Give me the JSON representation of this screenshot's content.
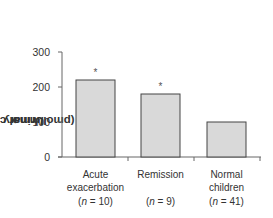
{
  "chart_data": {
    "type": "bar",
    "title": "",
    "xlabel": "",
    "ylabel": "Urinary LTE4 (pmol/mmol creatinine)",
    "ylabel_parts": {
      "prefix": "Urinary LTE",
      "sub": "4",
      "suffix": " (pmol/mmol creatinine)"
    },
    "ylim": [
      0,
      300
    ],
    "yticks": [
      0,
      100,
      200,
      300
    ],
    "grid": false,
    "legend": null,
    "categories": [
      "Acute exacerbation (n = 10)",
      "Remission (n = 9)",
      "Normal children (n = 41)"
    ],
    "category_lines": [
      [
        "Acute",
        "exacerbation",
        "(n = 10)"
      ],
      [
        "Remission",
        "",
        "(n = 9)"
      ],
      [
        "Normal",
        "children",
        "(n = 41)"
      ]
    ],
    "values": [
      220,
      180,
      100
    ],
    "annotations": [
      "*",
      "*",
      ""
    ],
    "bar_color": "#d9d9d9",
    "bar_edge_color": "#444444"
  }
}
